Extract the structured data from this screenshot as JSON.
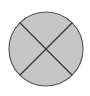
{
  "diagram": {
    "shape": "circle-with-x",
    "icon": "circle-cross-icon",
    "colors": {
      "fill": "#c6c6c6",
      "stroke": "#5a5a5a",
      "background": "#ffffff"
    },
    "geometry": {
      "cx": 46,
      "cy": 49,
      "r": 37
    }
  }
}
